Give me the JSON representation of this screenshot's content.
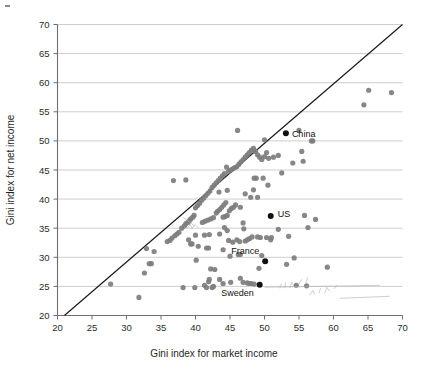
{
  "chart_data": {
    "type": "scatter",
    "title": "",
    "xlabel": "Gini index for market income",
    "ylabel": "Gini index for net income",
    "xlim": [
      20,
      70
    ],
    "ylim": [
      20,
      70
    ],
    "xticks": [
      20,
      25,
      30,
      35,
      40,
      45,
      50,
      55,
      60,
      65,
      70
    ],
    "yticks": [
      20,
      25,
      30,
      35,
      40,
      45,
      50,
      55,
      60,
      65,
      70
    ],
    "xticklabels": [
      "20",
      "25",
      "30",
      "35",
      "40",
      "45",
      "50",
      "55",
      "60",
      "65",
      "70"
    ],
    "yticklabels": [
      "20",
      "25",
      "30",
      "35",
      "40",
      "45",
      "50",
      "55",
      "60",
      "65",
      "70"
    ],
    "grid": "horizontal",
    "legend": "none",
    "reference_line": {
      "name": "identity-line",
      "description": "y = x diagonal",
      "from": [
        21,
        20
      ],
      "to": [
        70,
        70
      ]
    },
    "marker_color": "#7d7d7d",
    "highlight_color": "#111111",
    "annotations": [
      {
        "label": "China",
        "x": 53.1,
        "y": 51.3,
        "label_dx": 6,
        "label_dy": 4
      },
      {
        "label": "US",
        "x": 50.9,
        "y": 37.1,
        "label_dx": 7,
        "label_dy": 1
      },
      {
        "label": "France",
        "x": 50.1,
        "y": 29.3,
        "label_dx": -6,
        "label_dy": -7
      },
      {
        "label": "Sweden",
        "x": 49.3,
        "y": 25.3,
        "label_dx": -6,
        "label_dy": 11
      }
    ],
    "highlighted_points": [
      {
        "name": "China",
        "x": 53.1,
        "y": 51.3
      },
      {
        "name": "US",
        "x": 50.9,
        "y": 37.1
      },
      {
        "name": "France",
        "x": 50.1,
        "y": 29.3
      },
      {
        "name": "Sweden",
        "x": 49.3,
        "y": 25.3
      }
    ],
    "points": [
      [
        27.7,
        25.4
      ],
      [
        31.8,
        23.1
      ],
      [
        32.9,
        31.5
      ],
      [
        33.3,
        28.9
      ],
      [
        33.6,
        28.9
      ],
      [
        34.0,
        31.0
      ],
      [
        32.6,
        27.3
      ],
      [
        35.9,
        32.7
      ],
      [
        36.8,
        43.2
      ],
      [
        38.6,
        43.3
      ],
      [
        38.0,
        35.0
      ],
      [
        38.4,
        35.4
      ],
      [
        38.6,
        35.8
      ],
      [
        38.9,
        36.0
      ],
      [
        39.1,
        36.3
      ],
      [
        39.3,
        36.6
      ],
      [
        39.6,
        36.9
      ],
      [
        39.8,
        37.2
      ],
      [
        37.6,
        34.3
      ],
      [
        37.3,
        34.0
      ],
      [
        37.0,
        33.7
      ],
      [
        36.6,
        33.3
      ],
      [
        36.3,
        32.9
      ],
      [
        39.9,
        24.8
      ],
      [
        39.3,
        32.3
      ],
      [
        40.0,
        33.8
      ],
      [
        40.1,
        29.5
      ],
      [
        40.4,
        31.9
      ],
      [
        41.3,
        33.8
      ],
      [
        41.6,
        31.6
      ],
      [
        41.9,
        31.6
      ],
      [
        41.3,
        25.2
      ],
      [
        41.6,
        24.8
      ],
      [
        41.9,
        25.8
      ],
      [
        42.0,
        26.2
      ],
      [
        42.2,
        28.0
      ],
      [
        42.8,
        27.9
      ],
      [
        40.0,
        38.5
      ],
      [
        40.3,
        38.9
      ],
      [
        40.6,
        39.3
      ],
      [
        40.9,
        39.8
      ],
      [
        41.2,
        40.2
      ],
      [
        41.5,
        40.6
      ],
      [
        41.8,
        41.0
      ],
      [
        42.1,
        41.4
      ],
      [
        41.0,
        36.0
      ],
      [
        41.4,
        36.2
      ],
      [
        41.8,
        36.4
      ],
      [
        42.2,
        36.6
      ],
      [
        42.6,
        36.8
      ],
      [
        42.4,
        42.0
      ],
      [
        42.7,
        42.4
      ],
      [
        43.0,
        42.8
      ],
      [
        43.3,
        43.2
      ],
      [
        43.6,
        43.6
      ],
      [
        43.9,
        44.0
      ],
      [
        44.2,
        44.4
      ],
      [
        44.5,
        45.5
      ],
      [
        43.5,
        38.2
      ],
      [
        43.8,
        38.6
      ],
      [
        44.1,
        39.0
      ],
      [
        44.4,
        39.4
      ],
      [
        43.2,
        37.9
      ],
      [
        43.0,
        37.6
      ],
      [
        43.4,
        41.2
      ],
      [
        44.6,
        41.5
      ],
      [
        44.0,
        36.9
      ],
      [
        44.3,
        37.0
      ],
      [
        44.6,
        37.2
      ],
      [
        44.9,
        38.0
      ],
      [
        45.2,
        38.4
      ],
      [
        45.5,
        38.6
      ],
      [
        45.8,
        39.0
      ],
      [
        44.8,
        44.8
      ],
      [
        45.1,
        45.0
      ],
      [
        45.4,
        45.2
      ],
      [
        45.7,
        45.4
      ],
      [
        46.0,
        45.6
      ],
      [
        46.3,
        46.0
      ],
      [
        46.6,
        46.4
      ],
      [
        46.9,
        46.8
      ],
      [
        47.2,
        47.2
      ],
      [
        47.5,
        47.6
      ],
      [
        47.8,
        48.0
      ],
      [
        48.1,
        48.4
      ],
      [
        48.4,
        48.7
      ],
      [
        48.7,
        48.2
      ],
      [
        49.0,
        47.6
      ],
      [
        49.3,
        47.2
      ],
      [
        49.6,
        46.8
      ],
      [
        50.0,
        47.3
      ],
      [
        50.3,
        48.0
      ],
      [
        50.6,
        47.0
      ],
      [
        51.3,
        47.2
      ],
      [
        46.1,
        51.8
      ],
      [
        50.0,
        50.2
      ],
      [
        55.0,
        51.8
      ],
      [
        56.8,
        50.0
      ],
      [
        57.0,
        50.0
      ],
      [
        55.4,
        48.2
      ],
      [
        55.6,
        46.5
      ],
      [
        54.1,
        46.2
      ],
      [
        52.0,
        47.5
      ],
      [
        52.5,
        44.5
      ],
      [
        48.5,
        43.6
      ],
      [
        48.8,
        43.6
      ],
      [
        49.8,
        43.6
      ],
      [
        50.5,
        42.4
      ],
      [
        48.4,
        41.6
      ],
      [
        48.0,
        40.3
      ],
      [
        49.0,
        40.3
      ],
      [
        47.2,
        40.9
      ],
      [
        46.5,
        38.6
      ],
      [
        46.9,
        35.9
      ],
      [
        44.2,
        35.1
      ],
      [
        44.6,
        34.6
      ],
      [
        43.5,
        34.0
      ],
      [
        44.8,
        32.9
      ],
      [
        45.4,
        32.6
      ],
      [
        44.0,
        31.3
      ],
      [
        45.0,
        30.2
      ],
      [
        46.2,
        30.5
      ],
      [
        46.5,
        30.5
      ],
      [
        46.0,
        33.0
      ],
      [
        46.4,
        32.7
      ],
      [
        47.2,
        32.8
      ],
      [
        47.5,
        33.0
      ],
      [
        47.8,
        33.2
      ],
      [
        48.2,
        33.5
      ],
      [
        49.0,
        33.5
      ],
      [
        49.4,
        33.4
      ],
      [
        50.3,
        33.4
      ],
      [
        51.0,
        33.4
      ],
      [
        52.0,
        34.8
      ],
      [
        53.5,
        33.6
      ],
      [
        50.9,
        33.0
      ],
      [
        49.6,
        30.3
      ],
      [
        49.2,
        28.1
      ],
      [
        53.2,
        28.8
      ],
      [
        54.3,
        29.9
      ],
      [
        59.1,
        28.3
      ],
      [
        55.8,
        37.2
      ],
      [
        57.4,
        36.5
      ],
      [
        56.3,
        35.1
      ],
      [
        46.5,
        26.4
      ],
      [
        46.9,
        25.7
      ],
      [
        47.5,
        25.6
      ],
      [
        47.8,
        25.5
      ],
      [
        48.1,
        25.5
      ],
      [
        48.5,
        25.4
      ],
      [
        45.1,
        25.7
      ],
      [
        44.0,
        25.5
      ],
      [
        43.5,
        26.2
      ],
      [
        42.6,
        25.0
      ],
      [
        42.4,
        24.8
      ],
      [
        65.1,
        58.7
      ],
      [
        68.4,
        58.3
      ],
      [
        64.4,
        56.2
      ],
      [
        54.6,
        25.2
      ],
      [
        56.1,
        25.1
      ],
      [
        38.2,
        24.8
      ],
      [
        39.0,
        33.0
      ],
      [
        39.5,
        32.3
      ],
      [
        42.0,
        33.9
      ],
      [
        47.0,
        34.9
      ]
    ],
    "handwritten_notes": [
      {
        "name": "pencil-note-center",
        "x": 38.5,
        "y": 35.8,
        "text": ""
      },
      {
        "name": "pencil-note-bottom-right",
        "x": 58.0,
        "y": 24.5,
        "text": ""
      }
    ]
  },
  "axes": {
    "x_title": "Gini index for market income",
    "y_title": "Gini index for net income"
  }
}
